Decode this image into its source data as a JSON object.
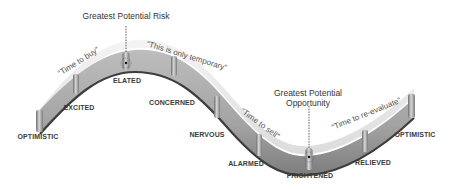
{
  "diagram": {
    "type": "investor-emotion-cycle",
    "colors": {
      "background": "#ffffff",
      "track_top": "#d9d9d9",
      "track_face": "#a8a8a8",
      "track_edge": "#4a4a4a",
      "post": "#8c8c8c",
      "text": "#3a3a3a",
      "quote_text": "#555555"
    },
    "callouts": {
      "risk": "Greatest Potential Risk",
      "opportunity_line1": "Greatest Potential",
      "opportunity_line2": "Opportunity"
    },
    "quotes": {
      "buy": "“Time to buy”",
      "temporary": "“This is only temporary”",
      "sell": "“Time to sell”",
      "reevaluate": "“Time to re-evaluate”"
    },
    "emotions": [
      {
        "label": "OPTIMISTIC"
      },
      {
        "label": "EXCITED"
      },
      {
        "label": "ELATED"
      },
      {
        "label": "CONCERNED"
      },
      {
        "label": "NERVOUS"
      },
      {
        "label": "ALARMED"
      },
      {
        "label": "FRIGHTENED"
      },
      {
        "label": "RELIEVED"
      },
      {
        "label": "OPTIMISTIC"
      }
    ]
  }
}
